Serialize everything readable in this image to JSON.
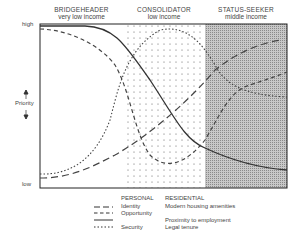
{
  "diagram": {
    "y_axis": {
      "label": "Priority",
      "high": "high",
      "low": "low"
    },
    "zones": [
      {
        "title": "BRIDGEHEADER",
        "subtitle": "very low income"
      },
      {
        "title": "CONSOLIDATOR",
        "subtitle": "low income"
      },
      {
        "title": "STATUS-SEEKER",
        "subtitle": "middle income"
      }
    ],
    "legend": {
      "col_personal": "PERSONAL",
      "col_residential": "RESIDENTIAL",
      "items": [
        {
          "style": "long-dash",
          "personal": "Identity",
          "residential": "Modern housing amenities"
        },
        {
          "style": "medium-dash",
          "personal": "Opportunity",
          "residential": ""
        },
        {
          "style": "solid",
          "personal": "",
          "residential": "Proximity to employment"
        },
        {
          "style": "dotted",
          "personal": "Security",
          "residential": "Legal tenure"
        }
      ]
    }
  }
}
